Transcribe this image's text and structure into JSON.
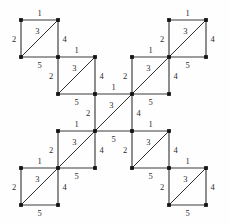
{
  "figure": {
    "type": "labeled-square-complex",
    "background_color": "#fefefe",
    "edge_color": "#3a3a3a",
    "diagonal_color": "#2e2e2e",
    "node_color": "#141414",
    "label_color": "#2b2b2b",
    "unit": 37,
    "square_count": 9,
    "edge_role_labels": {
      "top": "1",
      "left": "2",
      "diagonal": "3",
      "right": "4",
      "bottom": "5"
    },
    "squares": [
      {
        "id": "square-top-left-outer",
        "grid_col": 0,
        "grid_row": 0,
        "x": 21,
        "y": 20,
        "labels": {
          "top": "1",
          "left": "2",
          "diagonal": "3",
          "right": "4",
          "bottom": "5"
        }
      },
      {
        "id": "square-top-left-inner",
        "grid_col": 1,
        "grid_row": 1,
        "x": 58,
        "y": 57,
        "labels": {
          "top": "1",
          "left": "2",
          "diagonal": "3",
          "right": "4",
          "bottom": "5"
        }
      },
      {
        "id": "square-center",
        "grid_col": 2,
        "grid_row": 2,
        "x": 95,
        "y": 94,
        "labels": {
          "top": "1",
          "left": "2",
          "diagonal": "3",
          "right": "4",
          "bottom": "5"
        }
      },
      {
        "id": "square-top-right-inner",
        "grid_col": 3,
        "grid_row": 1,
        "x": 132,
        "y": 57,
        "labels": {
          "top": "1",
          "left": "2",
          "diagonal": "3",
          "right": "4",
          "bottom": "5"
        }
      },
      {
        "id": "square-top-right-outer",
        "grid_col": 4,
        "grid_row": 0,
        "x": 169,
        "y": 20,
        "labels": {
          "top": "1",
          "left": "2",
          "diagonal": "3",
          "right": "4",
          "bottom": "5"
        }
      },
      {
        "id": "square-bottom-left-inner",
        "grid_col": 1,
        "grid_row": 3,
        "x": 58,
        "y": 131,
        "labels": {
          "top": "1",
          "left": "2",
          "diagonal": "3",
          "right": "4",
          "bottom": "5"
        }
      },
      {
        "id": "square-bottom-left-outer",
        "grid_col": 0,
        "grid_row": 4,
        "x": 21,
        "y": 168,
        "labels": {
          "top": "1",
          "left": "2",
          "diagonal": "3",
          "right": "4",
          "bottom": "5"
        }
      },
      {
        "id": "square-bottom-right-inner",
        "grid_col": 3,
        "grid_row": 3,
        "x": 132,
        "y": 131,
        "labels": {
          "top": "1",
          "left": "2",
          "diagonal": "3",
          "right": "4",
          "bottom": "5"
        }
      },
      {
        "id": "square-bottom-right-outer",
        "grid_col": 4,
        "grid_row": 4,
        "x": 169,
        "y": 168,
        "labels": {
          "top": "1",
          "left": "2",
          "diagonal": "3",
          "right": "4",
          "bottom": "5"
        }
      }
    ]
  }
}
